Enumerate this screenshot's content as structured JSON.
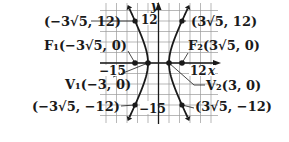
{
  "diagram": {
    "axes": {
      "x_label": "x",
      "y_label": "y"
    },
    "ticks": {
      "x_pos": "12",
      "x_neg": "−15",
      "y_pos": "12",
      "y_neg": "−15"
    },
    "labels": {
      "top_left_point": "(−3√5, 12)",
      "top_right_point": "(3√5, 12)",
      "focus_left": "F₁(−3√5, 0)",
      "focus_right": "F₂(3√5, 0)",
      "vertex_left": "V₁(−3, 0)",
      "vertex_right": "V₂(3, 0)",
      "bottom_left_point": "(−3√5, −12)",
      "bottom_right_point": "(3√5, −12)"
    },
    "colors": {
      "curve": "#1a1a1a",
      "grid": "#9a9a9a",
      "background": "#ffffff"
    }
  },
  "chart_data": {
    "type": "line",
    "title": "",
    "xlabel": "x",
    "ylabel": "y",
    "equation": "x^2/9 - y^2/36 = 1",
    "xlim": [
      -16.5,
      17
    ],
    "ylim": [
      -17,
      17
    ],
    "grid": true,
    "points": [
      {
        "label": "F1",
        "x": -6.708,
        "y": 0
      },
      {
        "label": "F2",
        "x": 6.708,
        "y": 0
      },
      {
        "label": "V1",
        "x": -3,
        "y": 0
      },
      {
        "label": "V2",
        "x": 3,
        "y": 0
      },
      {
        "label": "",
        "x": -6.708,
        "y": 12
      },
      {
        "label": "",
        "x": 6.708,
        "y": 12
      },
      {
        "label": "",
        "x": -6.708,
        "y": -12
      },
      {
        "label": "",
        "x": 6.708,
        "y": -12
      }
    ]
  }
}
